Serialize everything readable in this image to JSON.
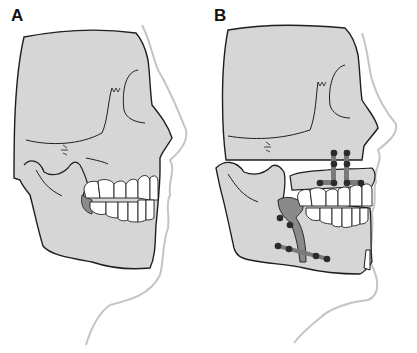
{
  "figure": {
    "panels": [
      {
        "id": "A",
        "label": "A",
        "description": "Skull profile, pre-operative (mandibular prognathism)"
      },
      {
        "id": "B",
        "label": "B",
        "description": "Skull profile after maxillary and mandibular osteotomy with plate fixation"
      }
    ],
    "colors": {
      "bone": "#d6d6d6",
      "outline": "#1e1e1e",
      "soft_tissue": "#c4c4c4",
      "teeth": "#ffffff",
      "cartilage": "#8a8a8a",
      "plate": "#7a7a7a",
      "screw": "#2b2b2b",
      "background": "#ffffff"
    },
    "fixation": {
      "maxilla_l_plates": 2,
      "maxilla_screws": 8,
      "mandible_screws": 6
    },
    "caption_cropped": true
  }
}
